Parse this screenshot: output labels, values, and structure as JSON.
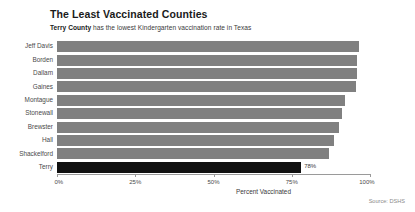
{
  "header": {
    "title": "The Least Vaccinated Counties",
    "subtitle_bold": "Terry County",
    "subtitle_rest": " has the lowest Kindergarten vaccination rate in Texas"
  },
  "footer": {
    "source": "Source: DSHS"
  },
  "colors": {
    "bar": "#808080",
    "highlight_bar": "#111111",
    "axis": "#9a9a9a",
    "title_text": "#1a1a1a",
    "label_text": "#4a4a4a"
  },
  "chart_data": {
    "type": "bar",
    "orientation": "horizontal",
    "title": "The Least Vaccinated Counties",
    "subtitle": "Terry County has the lowest Kindergarten vaccination rate in Texas",
    "xlabel": "Percent Vaccinated",
    "ylabel": "",
    "xlim": [
      0,
      100
    ],
    "grid": false,
    "legend": false,
    "xtick_labels": [
      "0%",
      "25%",
      "50%",
      "75%",
      "100%"
    ],
    "xtick_values": [
      0,
      25,
      50,
      75,
      100
    ],
    "categories": [
      "Jeff Davis",
      "Borden",
      "Dallam",
      "Gaines",
      "Montague",
      "Stonewall",
      "Brewster",
      "Hall",
      "Shackelford",
      "Terry"
    ],
    "values": [
      96.5,
      96.0,
      96.0,
      95.5,
      92.0,
      91.0,
      90.0,
      88.5,
      87.0,
      78.0
    ],
    "value_labels": [
      "",
      "",
      "",
      "",
      "",
      "",
      "",
      "",
      "",
      "78%"
    ],
    "highlight_category": "Terry"
  }
}
